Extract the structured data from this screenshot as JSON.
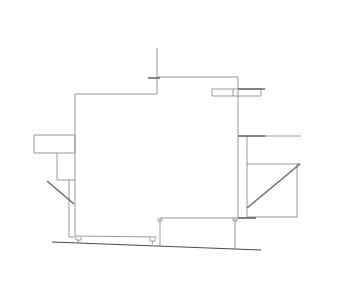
{
  "diagram": {
    "type": "architectural-elevation-line-drawing",
    "colors": {
      "background": "#ffffff",
      "thin_line": "#8c8c8c",
      "thick_line": "#6e6e6e",
      "ground_line": "#4a4a4a"
    },
    "elements": {
      "main_volume": "main-building-outline",
      "mast": "roof-mast",
      "left_box": "left-canopy-box",
      "left_sub_box": "left-lower-box",
      "left_brace": "left-diagonal-brace",
      "right_top_box": "right-top-ledge-box",
      "right_shelf": "right-shelf-line",
      "right_sub_box": "right-lower-box",
      "right_brace": "right-diagonal-brace",
      "ground": "ground-line"
    }
  }
}
